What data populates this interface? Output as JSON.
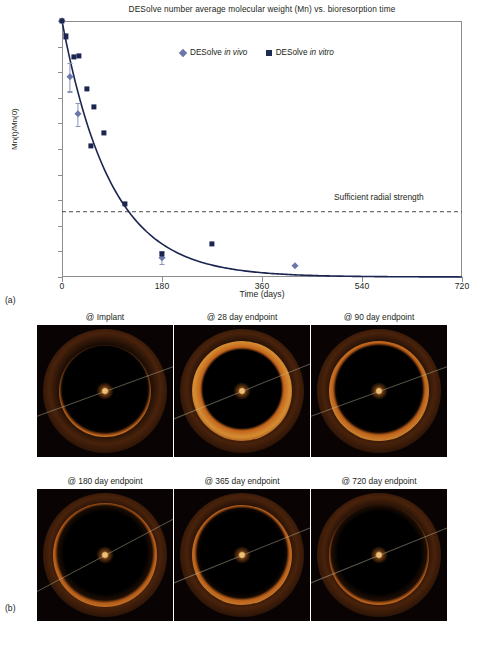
{
  "figure": {
    "panel_a_label": "(a)",
    "panel_b_label": "(b)"
  },
  "chart_data": {
    "type": "scatter",
    "title": "DESolve number average molecular weight (Mn) vs. bioresorption time",
    "xlabel": "Time (days)",
    "ylabel": "Mn(t)/Mn(0)",
    "xlim": [
      0,
      720
    ],
    "ylim": [
      0,
      100
    ],
    "xticks": [
      0,
      180,
      360,
      540,
      720
    ],
    "xtick_labels": [
      "0",
      "180",
      "360",
      "540",
      "720"
    ],
    "yticks": [
      0,
      10,
      20,
      30,
      40,
      50,
      60,
      70,
      80,
      90,
      100
    ],
    "ytick_labels": [
      "0%",
      "10%",
      "20%",
      "30%",
      "40%",
      "50%",
      "60%",
      "70%",
      "80%",
      "90%",
      "100%"
    ],
    "grid": false,
    "legend_position": "top-center",
    "legend": [
      {
        "name": "DESolve in vivo",
        "name_plain": "DESolve",
        "name_italic": "in vivo",
        "marker": "diamond",
        "color": "#6b77a8"
      },
      {
        "name": "DESolve in vitro",
        "name_plain": "DESolve",
        "name_italic": "in vitro",
        "marker": "square",
        "color": "#1f2a55"
      }
    ],
    "annotations": [
      {
        "text": "Sufficient radial strength",
        "y": 25.5,
        "type": "dashed-hline",
        "color": "#4a4a4a"
      }
    ],
    "series": [
      {
        "name": "DESolve in vitro",
        "marker": "square",
        "color": "#1b2550",
        "points": [
          {
            "x": 0,
            "y": 100
          },
          {
            "x": 7,
            "y": 94
          },
          {
            "x": 21,
            "y": 86
          },
          {
            "x": 31,
            "y": 86.5
          },
          {
            "x": 45,
            "y": 73.5
          },
          {
            "x": 58,
            "y": 66.5
          },
          {
            "x": 52,
            "y": 51.3
          },
          {
            "x": 75,
            "y": 56.3
          },
          {
            "x": 113,
            "y": 28.6
          },
          {
            "x": 180,
            "y": 9
          },
          {
            "x": 270,
            "y": 13
          }
        ]
      },
      {
        "name": "DESolve in vivo",
        "marker": "diamond",
        "color": "#6b77a8",
        "points": [
          {
            "x": 0,
            "y": 100,
            "err": 0
          },
          {
            "x": 14,
            "y": 78,
            "err": 5.5
          },
          {
            "x": 28,
            "y": 63.5,
            "err": 4.5
          },
          {
            "x": 180,
            "y": 7.5,
            "err": 2.5
          },
          {
            "x": 420,
            "y": 4.3,
            "err": 0
          }
        ]
      }
    ],
    "fit_curve": {
      "name": "exponential decay fit",
      "color": "#1b2550",
      "equation_form": "y = 100 * exp(-x/k)",
      "k_days": 88
    }
  },
  "panel_b": {
    "caption_images": [
      {
        "label": "@ Implant",
        "row": 0,
        "col": 0
      },
      {
        "label": "@ 28 day endpoint",
        "row": 0,
        "col": 1
      },
      {
        "label": "@ 90 day endpoint",
        "row": 0,
        "col": 2
      },
      {
        "label": "@ 180 day endpoint",
        "row": 1,
        "col": 0
      },
      {
        "label": "@ 365 day endpoint",
        "row": 1,
        "col": 1
      },
      {
        "label": "@ 720 day endpoint",
        "row": 1,
        "col": 2
      }
    ]
  }
}
